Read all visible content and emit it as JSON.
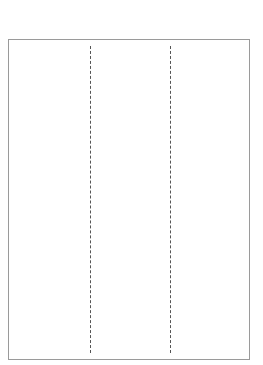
{
  "document": {
    "type": "trifold-layout",
    "panels": 3,
    "fold_lines": [
      {
        "position_px": 81,
        "style": "dashed"
      },
      {
        "position_px": 161,
        "style": "dashed"
      }
    ],
    "colors": {
      "border": "#9a9a9a",
      "fold_line": "#555555",
      "background": "#ffffff"
    }
  }
}
